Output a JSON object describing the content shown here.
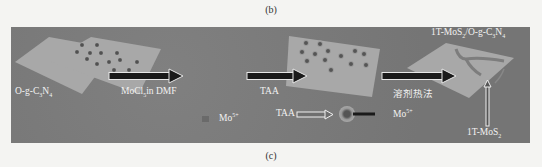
{
  "captions": {
    "top": "(b)",
    "bottom": "(c)"
  },
  "diagram": {
    "stages": [
      {
        "label_html": "O-g-C<sub>3</sub>N<sub>4</sub>",
        "desc": "bare O-g-C3N4 sheet"
      },
      {
        "label_html": "MoCl<sub>5</sub>in DMF",
        "desc": "Mo5+ ions adsorbed on sheet"
      },
      {
        "label_html": "TAA",
        "desc": "TAA coordinated with Mo5+"
      },
      {
        "label_html": "溶剂热法",
        "desc": "solvothermal treatment"
      },
      {
        "label_html": "1T-MoS<sub>2</sub>/O-g-C<sub>3</sub>N<sub>4</sub>",
        "desc": "product"
      }
    ],
    "product_pointer_label_html": "1T-MoS<sub>2</sub>",
    "legend": {
      "mo_ion_html": "Mo<sup>5+</sup>",
      "taa": "TAA",
      "complex_mo_html": "Mo<sup>5+</sup>"
    },
    "colors": {
      "background": "#7a7a7a",
      "sheet": "#a8a8a8",
      "arrow": "#1a1a1a",
      "arrow_outline": "#e8e8e8",
      "text": "#f2f2f2"
    }
  }
}
